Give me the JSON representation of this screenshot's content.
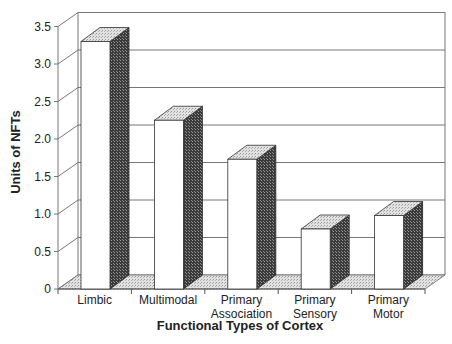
{
  "chart_data": {
    "type": "bar",
    "style": "3d-column",
    "title": "",
    "xlabel": "Functional Types of Cortex",
    "ylabel": "Units of NFTs",
    "categories": [
      "Limbic",
      "Multimodal",
      "Primary Association",
      "Primary Sensory",
      "Primary Motor"
    ],
    "category_lines": [
      [
        "Limbic"
      ],
      [
        "Multimodal"
      ],
      [
        "Primary",
        "Association"
      ],
      [
        "Primary",
        "Sensory"
      ],
      [
        "Primary",
        "Motor"
      ]
    ],
    "values": [
      3.3,
      2.25,
      1.73,
      0.8,
      0.98
    ],
    "ylim": [
      0,
      3.5
    ],
    "yticks": [
      "0",
      "0.5",
      "1.0",
      "1.5",
      "2.0",
      "2.5",
      "3.0",
      "3.5"
    ],
    "ytick_values": [
      0,
      0.5,
      1.0,
      1.5,
      2.0,
      2.5,
      3.0,
      3.5
    ],
    "grid": true,
    "legend": null
  },
  "colors": {
    "bar_front": "#ffffff",
    "bar_side": "#555555",
    "bar_top": "#d8d8d8",
    "floor": "#c8c8c8",
    "gridline": "#777777",
    "text": "#222222"
  }
}
